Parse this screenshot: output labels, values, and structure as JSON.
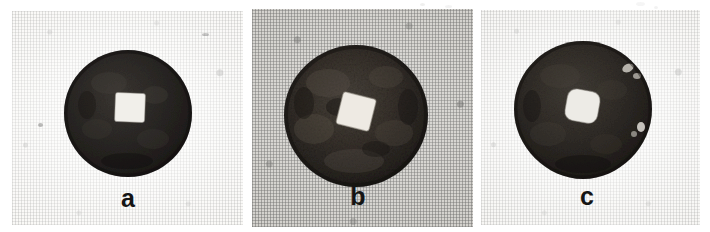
{
  "figure": {
    "background_color": "#ffffff",
    "panels": [
      {
        "id": "a",
        "label": "a",
        "background_color": "#f6f5f2",
        "background_texture": "woven-paper-light",
        "coin": {
          "shape": "round-disc",
          "body_color": "#2a2724",
          "rim_color": "#171513",
          "hole_shape": "square",
          "hole_color": "#f2f0ec",
          "hole_rotation_deg": 2,
          "diameter_px": 124,
          "hole_size_px": 30,
          "surface": "smooth-dark-patina"
        }
      },
      {
        "id": "b",
        "label": "b",
        "background_color": "#c9c7c2",
        "background_texture": "woven-paper-dark",
        "coin": {
          "shape": "round-disc",
          "body_color": "#3a3631",
          "rim_color": "#201d1a",
          "hole_shape": "square",
          "hole_color": "#efece6",
          "hole_rotation_deg": 14,
          "diameter_px": 143,
          "hole_size_px": 34,
          "surface": "rough-corroded-mottled"
        }
      },
      {
        "id": "c",
        "label": "c",
        "background_color": "#f4f3f0",
        "background_texture": "woven-paper-light",
        "coin": {
          "shape": "round-disc",
          "body_color": "#332f2b",
          "rim_color": "#1b1916",
          "hole_shape": "rounded-square",
          "hole_color": "#eeece7",
          "hole_rotation_deg": 10,
          "diameter_px": 136,
          "hole_size_px": 33,
          "surface": "dark-patina-with-light-chips"
        }
      }
    ]
  }
}
